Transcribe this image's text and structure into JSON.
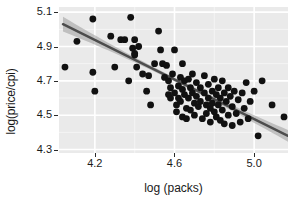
{
  "chart_data": {
    "type": "scatter",
    "title": "",
    "xlabel": "log (packs)",
    "ylabel": "log(price/cpi)",
    "xlim": [
      4.02,
      5.17
    ],
    "ylim": [
      4.28,
      5.13
    ],
    "xticks": [
      4.2,
      4.6,
      5.0
    ],
    "xtick_labels": [
      "4.2",
      "4.6",
      "5.0"
    ],
    "yticks": [
      4.3,
      4.5,
      4.7,
      4.9,
      5.1
    ],
    "ytick_labels": [
      "4.3",
      "4.5",
      "4.7",
      "4.9",
      "5.1"
    ],
    "grid": true,
    "grid_major": true,
    "grid_minor": true,
    "legend": "none",
    "point_color": "#111111",
    "point_size": 4.6,
    "panel_background": "#eaeaea",
    "gridline_color": "#ffffff",
    "minor_gridline_color": "#f4f4f4",
    "fit": {
      "type": "linear",
      "line_color": "#4d4d4d",
      "band_color": "#9a9a9a",
      "band_opacity": 0.55,
      "x_start": 4.04,
      "y_start": 5.03,
      "x_end": 5.17,
      "y_end": 4.38,
      "band_halfwidth_start": 0.043,
      "band_halfwidth_mid": 0.011,
      "band_halfwidth_end": 0.034
    },
    "points": [
      [
        4.05,
        4.78
      ],
      [
        4.11,
        4.93
      ],
      [
        4.19,
        5.06
      ],
      [
        4.19,
        4.75
      ],
      [
        4.2,
        4.64
      ],
      [
        4.28,
        4.96
      ],
      [
        4.3,
        4.78
      ],
      [
        4.33,
        4.94
      ],
      [
        4.35,
        4.94
      ],
      [
        4.37,
        4.7
      ],
      [
        4.38,
        5.07
      ],
      [
        4.39,
        4.89
      ],
      [
        4.4,
        4.94
      ],
      [
        4.4,
        4.86
      ],
      [
        4.4,
        4.85
      ],
      [
        4.41,
        4.78
      ],
      [
        4.42,
        4.9
      ],
      [
        4.44,
        4.74
      ],
      [
        4.46,
        4.64
      ],
      [
        4.47,
        4.73
      ],
      [
        4.48,
        4.56
      ],
      [
        4.5,
        4.8
      ],
      [
        4.52,
        4.99
      ],
      [
        4.53,
        4.88
      ],
      [
        4.54,
        4.8
      ],
      [
        4.55,
        4.72
      ],
      [
        4.56,
        4.79
      ],
      [
        4.57,
        4.7
      ],
      [
        4.57,
        4.62
      ],
      [
        4.58,
        4.66
      ],
      [
        4.58,
        4.6
      ],
      [
        4.59,
        4.74
      ],
      [
        4.6,
        4.88
      ],
      [
        4.6,
        4.63
      ],
      [
        4.61,
        4.56
      ],
      [
        4.61,
        4.52
      ],
      [
        4.62,
        4.67
      ],
      [
        4.62,
        4.6
      ],
      [
        4.63,
        4.72
      ],
      [
        4.63,
        4.58
      ],
      [
        4.64,
        4.8
      ],
      [
        4.64,
        4.65
      ],
      [
        4.64,
        4.49
      ],
      [
        4.65,
        4.7
      ],
      [
        4.65,
        4.62
      ],
      [
        4.66,
        4.54
      ],
      [
        4.66,
        4.48
      ],
      [
        4.67,
        4.71
      ],
      [
        4.67,
        4.6
      ],
      [
        4.68,
        4.66
      ],
      [
        4.68,
        4.53
      ],
      [
        4.69,
        4.74
      ],
      [
        4.69,
        4.63
      ],
      [
        4.7,
        4.57
      ],
      [
        4.7,
        4.5
      ],
      [
        4.71,
        4.69
      ],
      [
        4.71,
        4.61
      ],
      [
        4.72,
        4.55
      ],
      [
        4.73,
        4.66
      ],
      [
        4.73,
        4.58
      ],
      [
        4.74,
        4.48
      ],
      [
        4.75,
        4.73
      ],
      [
        4.75,
        4.63
      ],
      [
        4.76,
        4.56
      ],
      [
        4.76,
        4.51
      ],
      [
        4.77,
        4.68
      ],
      [
        4.77,
        4.6
      ],
      [
        4.78,
        4.54
      ],
      [
        4.78,
        4.46
      ],
      [
        4.79,
        4.64
      ],
      [
        4.79,
        4.57
      ],
      [
        4.8,
        4.71
      ],
      [
        4.8,
        4.52
      ],
      [
        4.81,
        4.62
      ],
      [
        4.81,
        4.49
      ],
      [
        4.82,
        4.66
      ],
      [
        4.82,
        4.56
      ],
      [
        4.83,
        4.6
      ],
      [
        4.83,
        4.47
      ],
      [
        4.84,
        4.7
      ],
      [
        4.84,
        4.53
      ],
      [
        4.85,
        4.63
      ],
      [
        4.85,
        4.45
      ],
      [
        4.86,
        4.58
      ],
      [
        4.87,
        4.66
      ],
      [
        4.87,
        4.5
      ],
      [
        4.88,
        4.61
      ],
      [
        4.89,
        4.55
      ],
      [
        4.89,
        4.44
      ],
      [
        4.9,
        4.64
      ],
      [
        4.91,
        4.51
      ],
      [
        4.92,
        4.59
      ],
      [
        4.93,
        4.46
      ],
      [
        4.94,
        4.63
      ],
      [
        4.95,
        4.54
      ],
      [
        4.96,
        4.69
      ],
      [
        4.97,
        4.48
      ],
      [
        4.98,
        4.58
      ],
      [
        5.0,
        4.64
      ],
      [
        5.02,
        4.38
      ],
      [
        5.04,
        4.7
      ],
      [
        5.09,
        4.56
      ],
      [
        5.15,
        4.49
      ]
    ]
  }
}
